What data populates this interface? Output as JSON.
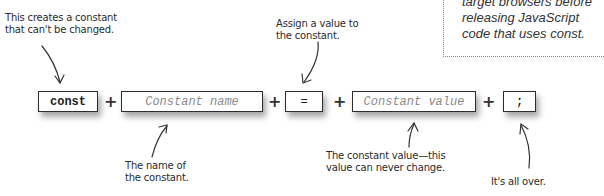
{
  "note": {
    "lines": [
      "target browsers before",
      "releasing JavaScript",
      "code that uses const."
    ]
  },
  "annotations": {
    "const": [
      "This creates a constant",
      "that can't be changed."
    ],
    "assign": [
      "Assign a value to",
      "the constant."
    ],
    "name": [
      "The name of",
      "the constant."
    ],
    "value": [
      "The constant value—this",
      "value can never change."
    ],
    "end": [
      "It's all over."
    ]
  },
  "tiles": {
    "keyword": "const",
    "name": "Constant name",
    "equals": "=",
    "value": "Constant value",
    "semicolon": ";"
  },
  "operators": {
    "plus": "+"
  }
}
